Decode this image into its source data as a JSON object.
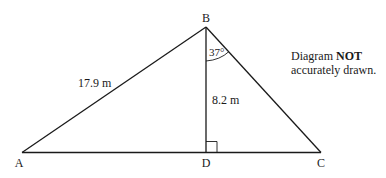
{
  "diagram": {
    "vertices": {
      "A": "A",
      "B": "B",
      "C": "C",
      "D": "D"
    },
    "measurements": {
      "AB": "17.9 m",
      "BD": "8.2 m",
      "angle_DBC": "37°"
    },
    "right_angle_at": "D",
    "note": {
      "line1_prefix": "Diagram ",
      "line1_bold": "NOT",
      "line2": "accurately drawn."
    },
    "colors": {
      "stroke": "#1a1a1a",
      "background": "#ffffff"
    }
  }
}
